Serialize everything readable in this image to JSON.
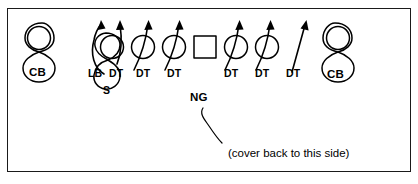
{
  "diagram": {
    "kind": "football-defensive-alignment",
    "background_color": "#ffffff",
    "border_color": "#1a1a1a",
    "stroke_color": "#000000",
    "line_of_scrimmage_positions": [
      {
        "name": "cb-left",
        "shape": "figure-eight",
        "label": "CB",
        "x": 42,
        "y": 40
      },
      {
        "name": "lb-left",
        "shape": "figure-eight",
        "label": "S",
        "x": 110,
        "y": 42
      },
      {
        "name": "dt-1",
        "shape": "circle",
        "x": 112,
        "y": 47
      },
      {
        "name": "dt-2",
        "shape": "circle",
        "x": 143,
        "y": 47
      },
      {
        "name": "dt-3",
        "shape": "circle",
        "x": 174,
        "y": 47
      },
      {
        "name": "center",
        "shape": "square",
        "x": 205,
        "y": 47
      },
      {
        "name": "dt-4",
        "shape": "circle",
        "x": 236,
        "y": 47
      },
      {
        "name": "dt-5",
        "shape": "circle",
        "x": 267,
        "y": 47
      },
      {
        "name": "cb-right",
        "shape": "figure-eight",
        "label": "CB",
        "x": 337,
        "y": 40
      }
    ],
    "labels": {
      "cb_left": "CB",
      "cb_right": "CB",
      "safety": "S",
      "linebacker": "LB",
      "nose_guard": "NG",
      "line_labels": [
        "LB",
        "DT",
        "DT",
        "DT",
        "DT",
        "DT",
        "DT"
      ]
    },
    "caption": "(cover back to this side)",
    "arrow_count": 7,
    "arrows": [
      {
        "name": "lb-rush-arrow",
        "style": "curved-left"
      },
      {
        "name": "dt-rush-arrow-1",
        "style": "curved-up"
      },
      {
        "name": "dt-rush-arrow-2",
        "style": "curved-up"
      },
      {
        "name": "dt-rush-arrow-3",
        "style": "curved-up"
      },
      {
        "name": "dt-rush-arrow-4",
        "style": "curved-up"
      },
      {
        "name": "dt-rush-arrow-5",
        "style": "curved-up"
      },
      {
        "name": "dt-rush-arrow-6",
        "style": "straight-diagonal"
      }
    ],
    "leader_line": {
      "name": "ng-leader-line",
      "style": "s-curve"
    }
  }
}
